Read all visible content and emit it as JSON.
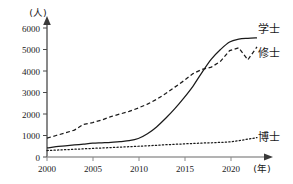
{
  "chart_data": {
    "type": "line",
    "title": "",
    "xlabel": "(年)",
    "ylabel": "(人)",
    "xlim": [
      2000,
      2023
    ],
    "ylim": [
      0,
      6000
    ],
    "grid": false,
    "legend_position": "right-inline",
    "xticks": [
      "2000",
      "2005",
      "2010",
      "2015",
      "2020"
    ],
    "xtick_values": [
      2000,
      2005,
      2010,
      2015,
      2020
    ],
    "yticks": [
      "0",
      "1000",
      "2000",
      "3000",
      "4000",
      "5000",
      "6000"
    ],
    "ytick_values": [
      0,
      1000,
      2000,
      3000,
      4000,
      5000,
      6000
    ],
    "x": [
      2000,
      2001,
      2002,
      2003,
      2004,
      2005,
      2006,
      2007,
      2008,
      2009,
      2010,
      2011,
      2012,
      2013,
      2014,
      2015,
      2016,
      2017,
      2018,
      2019,
      2020,
      2021,
      2022,
      2023
    ],
    "series": [
      {
        "name": "学士",
        "style": "solid",
        "color": "#1a1a1a",
        "values": [
          420,
          480,
          520,
          560,
          600,
          640,
          660,
          680,
          720,
          760,
          860,
          1080,
          1400,
          1800,
          2250,
          2750,
          3300,
          3950,
          4550,
          5000,
          5350,
          5480,
          5520,
          5540
        ]
      },
      {
        "name": "修士",
        "style": "dashed",
        "color": "#1a1a1a",
        "values": [
          880,
          1000,
          1120,
          1250,
          1520,
          1600,
          1720,
          1880,
          2000,
          2120,
          2280,
          2460,
          2680,
          2950,
          3250,
          3550,
          3880,
          4080,
          4180,
          4450,
          4950,
          5080,
          4520,
          5120
        ]
      },
      {
        "name": "博士",
        "style": "dotted",
        "color": "#1a1a1a",
        "values": [
          300,
          320,
          340,
          360,
          380,
          400,
          420,
          440,
          460,
          480,
          500,
          520,
          545,
          570,
          590,
          610,
          630,
          650,
          660,
          680,
          700,
          760,
          830,
          900
        ]
      }
    ],
    "annotations": [
      {
        "text": "学士",
        "x": 2023,
        "y": 5540
      },
      {
        "text": "修士",
        "x": 2023,
        "y": 5120
      },
      {
        "text": "博士",
        "x": 2023,
        "y": 900
      }
    ]
  }
}
